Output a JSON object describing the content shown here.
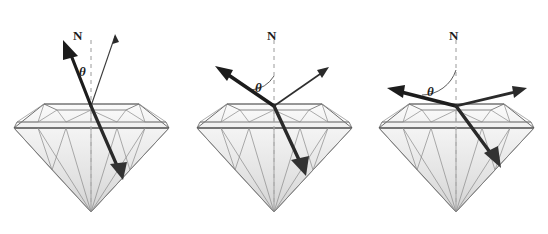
{
  "figure": {
    "background_color": "#ffffff",
    "width": 548,
    "height": 234,
    "ink_color": "#333333",
    "ray_color": "#1c1c1c",
    "gem_outline_color": "#555555",
    "gem_facet_color": "#888888",
    "normal_line_color": "#999999"
  },
  "panels": [
    {
      "id": "panel-1",
      "normal_label": "N",
      "angle_label": "θ",
      "incidence_angle_deg": 18,
      "incident_ray_name": "incident-ray",
      "reflected_ray_name": "reflected-ray",
      "refracted_ray_name": "refracted-ray",
      "normal_name": "normal-line",
      "gem_name": "diamond-gem"
    },
    {
      "id": "panel-2",
      "normal_label": "N",
      "angle_label": "θ",
      "incidence_angle_deg": 55,
      "incident_ray_name": "incident-ray",
      "reflected_ray_name": "reflected-ray",
      "refracted_ray_name": "refracted-ray",
      "normal_name": "normal-line",
      "gem_name": "diamond-gem"
    },
    {
      "id": "panel-3",
      "normal_label": "N",
      "angle_label": "θ",
      "incidence_angle_deg": 80,
      "incident_ray_name": "incident-ray",
      "reflected_ray_name": "reflected-ray",
      "refracted_ray_name": "refracted-ray",
      "normal_name": "normal-line",
      "gem_name": "diamond-gem"
    }
  ]
}
